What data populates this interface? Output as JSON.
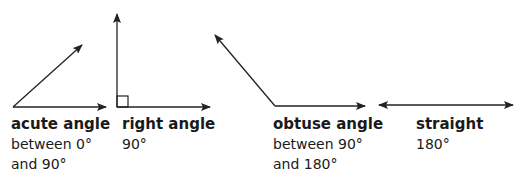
{
  "angles": [
    {
      "name": "acute angle",
      "line1": "between 0°",
      "line2": "and 90°"
    },
    {
      "name": "right angle",
      "line1": "90°",
      "line2": ""
    },
    {
      "name": "obtuse angle",
      "line1": "between 90°",
      "line2": "and 180°"
    },
    {
      "name": "straight",
      "line1": "180°",
      "line2": ""
    }
  ],
  "colors": {
    "stroke": "#222222",
    "text": "#1a1a1a"
  }
}
